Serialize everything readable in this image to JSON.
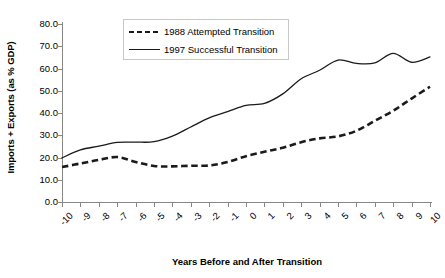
{
  "chart_data": {
    "type": "line",
    "title": "",
    "xlabel": "Years Before and After Transition",
    "ylabel": "Imports + Exports (as % GDP)",
    "xlim": [
      -10,
      10
    ],
    "ylim": [
      0,
      80
    ],
    "ytick_labels": [
      "80.0",
      "70.0",
      "60.0",
      "50.0",
      "40.0",
      "30.0",
      "20.0",
      "10.0",
      "0.0"
    ],
    "ytick_values": [
      80,
      70,
      60,
      50,
      40,
      30,
      20,
      10,
      0
    ],
    "xtick_labels": [
      "-10",
      "-9",
      "-8",
      "-7",
      "-6",
      "-5",
      "-4",
      "-3",
      "-2",
      "-1",
      "0",
      "1",
      "2",
      "3",
      "4",
      "5",
      "6",
      "7",
      "8",
      "9",
      "10"
    ],
    "x": [
      -10,
      -9,
      -8,
      -7,
      -6,
      -5,
      -4,
      -3,
      -2,
      -1,
      0,
      1,
      2,
      3,
      4,
      5,
      6,
      7,
      8,
      9,
      10
    ],
    "grid": false,
    "legend_position": "top-center",
    "series": [
      {
        "name": "1988 Attempted Transition",
        "style": "dashed",
        "color": "#1a1a1a",
        "values": [
          15.7,
          17.3,
          18.9,
          20.2,
          18.0,
          16.2,
          16.0,
          16.3,
          16.4,
          18.0,
          20.6,
          22.6,
          24.4,
          26.9,
          28.6,
          29.5,
          32.0,
          36.5,
          41.0,
          46.5,
          51.8
        ]
      },
      {
        "name": "1997 Successful Transition",
        "style": "solid",
        "color": "#1a1a1a",
        "values": [
          19.8,
          23.4,
          25.1,
          26.8,
          26.9,
          27.1,
          29.6,
          33.7,
          37.8,
          40.6,
          43.4,
          44.3,
          48.6,
          55.4,
          59.2,
          63.8,
          62.3,
          62.5,
          66.8,
          62.8,
          65.2
        ]
      }
    ]
  },
  "legend": {
    "entries": [
      {
        "label": "1988 Attempted Transition"
      },
      {
        "label": "1997 Successful Transition"
      }
    ]
  }
}
